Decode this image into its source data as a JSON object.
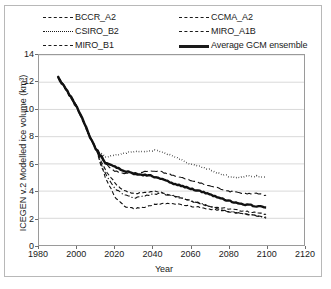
{
  "chart_data": {
    "type": "line",
    "title": "",
    "xlabel": "Year",
    "ylabel": "ICEGEN v.2 Modelled ice volume (km³)",
    "xlim": [
      1980,
      2120
    ],
    "ylim": [
      0,
      14
    ],
    "xticks": [
      1980,
      2000,
      2020,
      2040,
      2060,
      2080,
      2100,
      2120
    ],
    "yticks": [
      0,
      2,
      4,
      6,
      8,
      10,
      12,
      14
    ],
    "grid": "horizontal",
    "legend_position": "above-plot",
    "series": [
      {
        "name": "BCCR_A2",
        "style": "dashed",
        "x": [
          1990,
          1995,
          2000,
          2005,
          2010,
          2015,
          2020,
          2025,
          2030,
          2035,
          2040,
          2045,
          2050,
          2055,
          2060,
          2065,
          2070,
          2075,
          2080,
          2085,
          2090,
          2095,
          2100
        ],
        "values": [
          12.4,
          11.3,
          10.2,
          8.6,
          7.1,
          5.6,
          4.6,
          4.0,
          3.8,
          3.9,
          4.0,
          3.9,
          3.7,
          3.5,
          3.3,
          3.1,
          2.9,
          2.8,
          2.7,
          2.6,
          2.5,
          2.4,
          2.3
        ]
      },
      {
        "name": "CSIRO_B2",
        "style": "dotted",
        "x": [
          1990,
          1995,
          2000,
          2005,
          2010,
          2015,
          2020,
          2025,
          2030,
          2035,
          2040,
          2045,
          2050,
          2055,
          2060,
          2065,
          2070,
          2075,
          2080,
          2085,
          2090,
          2095,
          2100
        ],
        "values": [
          12.4,
          11.3,
          10.2,
          8.6,
          7.1,
          6.5,
          6.6,
          6.8,
          6.9,
          6.9,
          7.0,
          6.9,
          6.6,
          6.3,
          6.0,
          5.8,
          5.6,
          5.3,
          5.1,
          5.0,
          5.1,
          5.1,
          5.0
        ]
      },
      {
        "name": "MIRO_B1",
        "style": "dash-dot",
        "x": [
          1990,
          1995,
          2000,
          2005,
          2010,
          2015,
          2020,
          2025,
          2030,
          2035,
          2040,
          2045,
          2050,
          2055,
          2060,
          2065,
          2070,
          2075,
          2080,
          2085,
          2090,
          2095,
          2100
        ],
        "values": [
          12.4,
          11.3,
          10.2,
          8.6,
          7.1,
          5.3,
          4.2,
          3.7,
          3.5,
          3.6,
          3.8,
          3.8,
          3.7,
          3.5,
          3.3,
          3.1,
          2.9,
          2.7,
          2.5,
          2.4,
          2.3,
          2.2,
          2.1
        ]
      },
      {
        "name": "CCMA_A2",
        "style": "long-dash",
        "x": [
          1990,
          1995,
          2000,
          2005,
          2010,
          2015,
          2020,
          2025,
          2030,
          2035,
          2040,
          2045,
          2050,
          2055,
          2060,
          2065,
          2070,
          2075,
          2080,
          2085,
          2090,
          2095,
          2100
        ],
        "values": [
          12.4,
          11.3,
          10.2,
          8.6,
          7.1,
          6.0,
          5.5,
          5.3,
          5.3,
          5.4,
          5.5,
          5.4,
          5.2,
          5.0,
          4.8,
          4.6,
          4.4,
          4.2,
          4.0,
          3.9,
          3.8,
          3.8,
          3.7
        ]
      },
      {
        "name": "MIRO_A1B",
        "style": "dashed",
        "x": [
          1990,
          1995,
          2000,
          2005,
          2010,
          2015,
          2020,
          2025,
          2030,
          2035,
          2040,
          2045,
          2050,
          2055,
          2060,
          2065,
          2070,
          2075,
          2080,
          2085,
          2090,
          2095,
          2100
        ],
        "values": [
          12.4,
          11.3,
          10.2,
          8.6,
          7.1,
          5.0,
          3.6,
          2.9,
          2.7,
          2.8,
          3.0,
          3.1,
          3.1,
          3.0,
          2.9,
          2.8,
          2.7,
          2.6,
          2.5,
          2.4,
          2.3,
          2.2,
          2.0
        ]
      },
      {
        "name": "Average GCM ensemble",
        "style": "thick-solid",
        "x": [
          1990,
          1995,
          2000,
          2005,
          2010,
          2015,
          2020,
          2025,
          2030,
          2035,
          2040,
          2045,
          2050,
          2055,
          2060,
          2065,
          2070,
          2075,
          2080,
          2085,
          2090,
          2095,
          2100
        ],
        "values": [
          12.4,
          11.3,
          10.2,
          8.6,
          7.1,
          6.1,
          5.8,
          5.5,
          5.3,
          5.2,
          5.1,
          4.9,
          4.6,
          4.4,
          4.2,
          4.0,
          3.8,
          3.5,
          3.3,
          3.1,
          3.0,
          2.9,
          2.8
        ]
      }
    ]
  },
  "legend": {
    "columns": [
      [
        {
          "label": "BCCR_A2",
          "style": "dashed"
        },
        {
          "label": "CSIRO_B2",
          "style": "dotted"
        },
        {
          "label": "MIRO_B1",
          "style": "dash-dot"
        }
      ],
      [
        {
          "label": "CCMA_A2",
          "style": "long-dash"
        },
        {
          "label": "MIRO_A1B",
          "style": "dashed"
        },
        {
          "label": "Average GCM ensemble",
          "style": "thick-solid"
        }
      ]
    ]
  }
}
